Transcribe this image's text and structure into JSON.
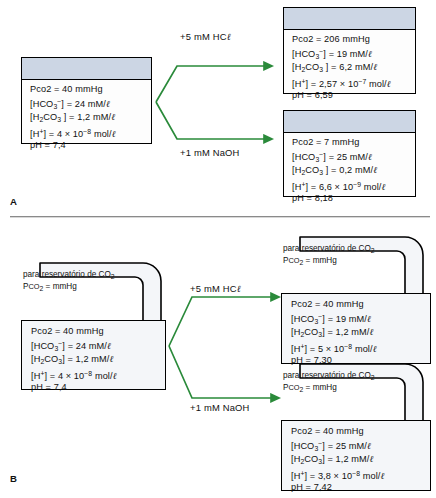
{
  "figure": {
    "panel_a_label": "A",
    "panel_b_label": "B"
  },
  "panel_a": {
    "name": "closed-system",
    "initial": {
      "pco2": "Pco2 = 40 mmHg",
      "hco3": "[HCO3−] = 24 mM/ℓ",
      "h2co3": "[H2CO3 ] = 1,2 mM/ℓ",
      "h": "[H+] = 4 × 10−8 mol/ℓ",
      "ph": "pH = 7,4"
    },
    "acid_arrow_label": "+5 mM HCℓ",
    "base_arrow_label": "+1 mM NaOH",
    "after_acid": {
      "pco2": "Pco2 = 206 mmHg",
      "hco3": "[HCO3−] = 19 mM/ℓ",
      "h2co3": "[H2CO3 ] = 6,2 mM/ℓ",
      "h": "[H+] = 2,57 × 10−7 mol/ℓ",
      "ph": "pH = 6,59"
    },
    "after_base": {
      "pco2": "Pco2 = 7 mmHg",
      "hco3": "[HCO3−] = 25 mM/ℓ",
      "h2co3": "[H2CO3 ] = 0,2 mM/ℓ",
      "h": "[H+] = 6,6 × 10−9 mol/ℓ",
      "ph": "pH = 8,18"
    }
  },
  "panel_b": {
    "name": "open-system",
    "reservoir_line1": "para reservatório de CO2",
    "reservoir_line2": "PCO2 = mmHg",
    "initial": {
      "pco2": "Pco2 = 40 mmHg",
      "hco3": "[HCO3−] = 24 mM/ℓ",
      "h2co3": "[H2CO3] = 1,2 mM/ℓ",
      "h": "[H+] = 4 × 10−8 mol/ℓ",
      "ph": "pH = 7,4"
    },
    "acid_arrow_label": "+5 mM HCℓ",
    "base_arrow_label": "+1 mM NaOH",
    "after_acid": {
      "pco2": "Pco2 = 40 mmHg",
      "hco3": "[HCO3−] = 19 mM/ℓ",
      "h2co3": "[H2CO3] = 1,2 mM/ℓ",
      "h": "[H+] = 5 × 10−8 mol/ℓ",
      "ph": "pH = 7,30"
    },
    "after_base": {
      "pco2": "Pco2 = 40 mmHg",
      "hco3": "[HCO3−] = 25 mM/ℓ",
      "h2co3": "[H2CO3] = 1,2 mM/ℓ",
      "h": "[H+] = 3,8 × 10−8 mol/ℓ",
      "ph": "pH = 7,42"
    }
  },
  "colors": {
    "arrow_green": "#2a8a3a",
    "box_header_blue": "#ccd6e4",
    "box_fill": "#f4f6f9",
    "outline": "#000000"
  }
}
